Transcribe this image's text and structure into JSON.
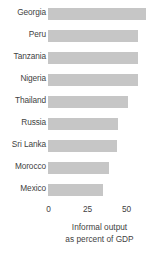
{
  "chart_data": {
    "type": "bar",
    "orientation": "horizontal",
    "title": "",
    "xlabel_lines": [
      "Informal output",
      "as percent of GDP"
    ],
    "ylabel": "",
    "categories": [
      "Georgia",
      "Peru",
      "Tanzania",
      "Nigeria",
      "Thailand",
      "Russia",
      "Sri Lanka",
      "Morocco",
      "Mexico"
    ],
    "values": [
      63,
      58,
      58,
      58,
      51,
      45,
      44,
      39,
      35
    ],
    "xticks": [
      0,
      25,
      50
    ],
    "xtick_labels": [
      "0",
      "25",
      "50"
    ],
    "xlim": [
      0,
      70
    ],
    "grid": false,
    "legend": false,
    "bar_color": "#c6c6c6",
    "text_color": "#3f3f3f",
    "background": "#ffffff"
  }
}
